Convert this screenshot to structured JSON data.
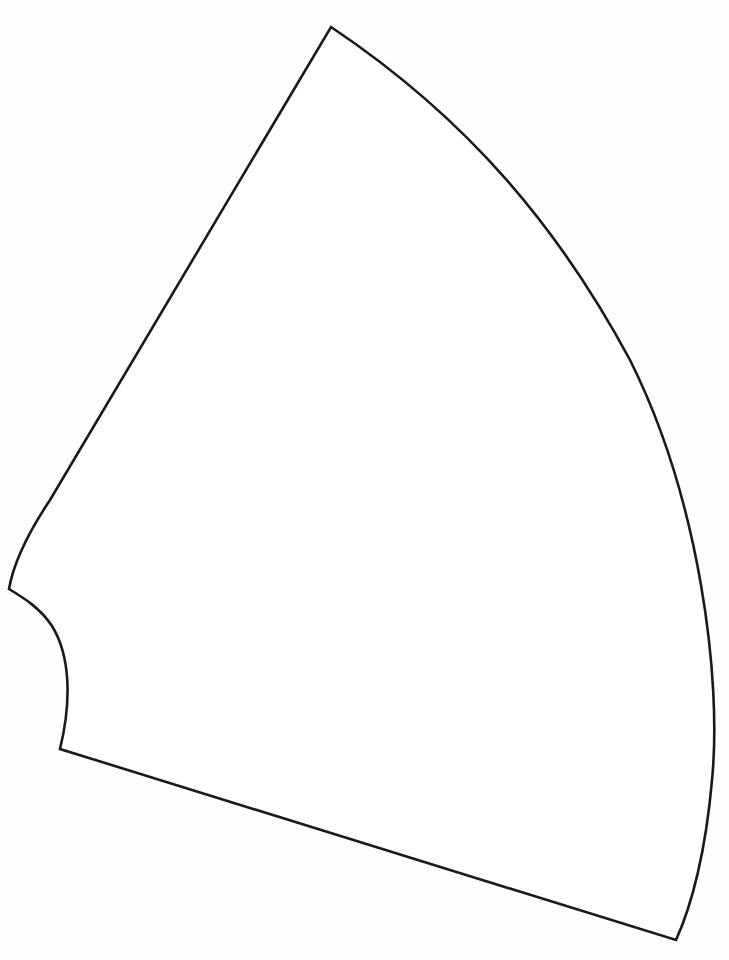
{
  "diagram": {
    "type": "line-art",
    "canvas": {
      "width": 729,
      "height": 960,
      "background": "#ffffff"
    },
    "stroke_color": "#1a1a1a",
    "stroke_width": 2.6,
    "shape": {
      "name": "truncated-sector",
      "path": "M 331 27 C 470 120 560 230 630 360 C 700 500 722 680 712 780 C 706 850 692 905 676 940 L 60 749 C 72 700 70 655 52 626 C 40 608 24 598 9 589 C 14 560 30 530 50 500 L 331 27 Z",
      "vertices": {
        "top": [
          331,
          27
        ],
        "left": [
          9,
          589
        ],
        "inner_arc_bottom": [
          60,
          749
        ],
        "bottom_right": [
          676,
          940
        ]
      },
      "edges": [
        {
          "name": "left-straight-edge",
          "from": [
            331,
            27
          ],
          "to": [
            9,
            589
          ]
        },
        {
          "name": "outer-arc",
          "from": [
            331,
            27
          ],
          "to": [
            676,
            940
          ]
        },
        {
          "name": "bottom-straight-edge",
          "from": [
            60,
            749
          ],
          "to": [
            676,
            940
          ]
        },
        {
          "name": "inner-arc",
          "from": [
            9,
            589
          ],
          "to": [
            60,
            749
          ]
        }
      ]
    }
  }
}
